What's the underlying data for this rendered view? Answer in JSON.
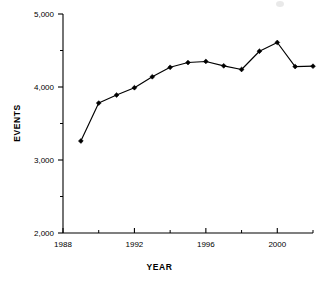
{
  "chart_data": {
    "type": "line",
    "title": "",
    "xlabel": "YEAR",
    "ylabel": "EVENTS",
    "xlim": [
      1988,
      2002
    ],
    "ylim": [
      2000,
      5000
    ],
    "grid": false,
    "legend": "none",
    "x_tick_labels": [
      "1988",
      "1992",
      "1996",
      "2000"
    ],
    "x_tick_values": [
      1988,
      1992,
      1996,
      2000
    ],
    "x_minor_tick_values": [
      1990,
      1994,
      1998,
      2002
    ],
    "y_tick_labels": [
      "2,000",
      "3,000",
      "4,000",
      "5,000"
    ],
    "y_tick_values": [
      2000,
      3000,
      4000,
      5000
    ],
    "y_minor_tick_values": [
      2500,
      3500,
      4500
    ],
    "marker": "filled-diamond",
    "line_color": "#000000",
    "x": [
      1989,
      1990,
      1991,
      1992,
      1993,
      1994,
      1995,
      1996,
      1997,
      1998,
      1999,
      2000,
      2001,
      2002
    ],
    "values": [
      3260,
      3780,
      3890,
      3990,
      4140,
      4270,
      4335,
      4350,
      4290,
      4240,
      4490,
      4610,
      4280,
      4285
    ],
    "series": [
      {
        "name": "EVENTS",
        "values": [
          3260,
          3780,
          3890,
          3990,
          4140,
          4270,
          4335,
          4350,
          4290,
          4240,
          4490,
          4610,
          4280,
          4285
        ]
      }
    ]
  },
  "axis": {
    "ylabel": "EVENTS",
    "xlabel": "YEAR"
  }
}
